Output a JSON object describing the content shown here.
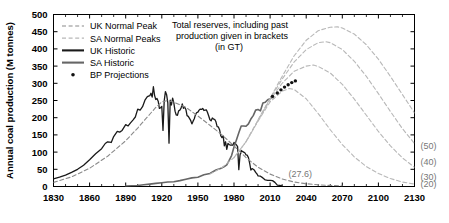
{
  "chart_data": {
    "type": "line",
    "title": "",
    "xlabel": "",
    "ylabel": "Annual coal production (M tonnes)",
    "xlim": [
      1830,
      2130
    ],
    "ylim": [
      0,
      500
    ],
    "xticks": [
      1830,
      1860,
      1890,
      1920,
      1950,
      1980,
      2010,
      2040,
      2070,
      2100,
      2130
    ],
    "yticks": [
      0,
      50,
      100,
      150,
      200,
      250,
      300,
      350,
      400,
      450,
      500
    ],
    "xtick_step": 30,
    "ytick_step": 50,
    "grid": false,
    "legend_position": "top-left",
    "annotation": {
      "line1": "Total reserves, including past",
      "line2": "production given in brackets",
      "line3": "(in GT)"
    },
    "inline_labels": [
      {
        "text": "(27.6)",
        "x": 2035,
        "y": 28
      }
    ],
    "right_axis_labels": [
      {
        "text": "(50)",
        "y": 118
      },
      {
        "text": "(40)",
        "y": 72
      },
      {
        "text": "(30)",
        "y": 30
      },
      {
        "text": "(20)",
        "y": 7
      }
    ],
    "legend": [
      {
        "label": "UK Normal Peak",
        "style": "dashed",
        "color": "#8a8a8a"
      },
      {
        "label": "SA Normal Peaks",
        "style": "dashed",
        "color": "#b8b8b8"
      },
      {
        "label": "UK Historic",
        "style": "solid",
        "color": "#1a1a1a"
      },
      {
        "label": "SA Historic",
        "style": "solid",
        "color": "#666666"
      },
      {
        "label": "BP Projections",
        "style": "dots",
        "color": "#111111"
      }
    ],
    "series": [
      {
        "name": "UK Historic",
        "style": "solid",
        "color": "#1a1a1a",
        "width": 1.3,
        "points": [
          [
            1830,
            22
          ],
          [
            1835,
            27
          ],
          [
            1840,
            33
          ],
          [
            1845,
            41
          ],
          [
            1850,
            50
          ],
          [
            1855,
            62
          ],
          [
            1860,
            78
          ],
          [
            1865,
            95
          ],
          [
            1870,
            110
          ],
          [
            1873,
            125
          ],
          [
            1875,
            130
          ],
          [
            1878,
            128
          ],
          [
            1880,
            145
          ],
          [
            1883,
            160
          ],
          [
            1885,
            158
          ],
          [
            1887,
            163
          ],
          [
            1890,
            180
          ],
          [
            1892,
            176
          ],
          [
            1894,
            185
          ],
          [
            1896,
            193
          ],
          [
            1898,
            202
          ],
          [
            1900,
            225
          ],
          [
            1902,
            222
          ],
          [
            1904,
            232
          ],
          [
            1906,
            251
          ],
          [
            1908,
            261
          ],
          [
            1910,
            264
          ],
          [
            1911,
            271
          ],
          [
            1912,
            260
          ],
          [
            1913,
            290
          ],
          [
            1914,
            265
          ],
          [
            1915,
            253
          ],
          [
            1916,
            256
          ],
          [
            1917,
            248
          ],
          [
            1918,
            227
          ],
          [
            1919,
            229
          ],
          [
            1920,
            233
          ],
          [
            1921,
            163
          ],
          [
            1922,
            249
          ],
          [
            1923,
            276
          ],
          [
            1924,
            267
          ],
          [
            1925,
            243
          ],
          [
            1926,
            126
          ],
          [
            1927,
            251
          ],
          [
            1928,
            237
          ],
          [
            1929,
            257
          ],
          [
            1930,
            243
          ],
          [
            1931,
            219
          ],
          [
            1932,
            208
          ],
          [
            1933,
            207
          ],
          [
            1934,
            220
          ],
          [
            1935,
            222
          ],
          [
            1936,
            228
          ],
          [
            1937,
            240
          ],
          [
            1938,
            227
          ],
          [
            1939,
            231
          ],
          [
            1940,
            224
          ],
          [
            1941,
            206
          ],
          [
            1942,
            204
          ],
          [
            1943,
            198
          ],
          [
            1944,
            192
          ],
          [
            1945,
            182
          ],
          [
            1946,
            190
          ],
          [
            1947,
            197
          ],
          [
            1948,
            209
          ],
          [
            1949,
            215
          ],
          [
            1950,
            216
          ],
          [
            1951,
            222
          ],
          [
            1952,
            225
          ],
          [
            1953,
            224
          ],
          [
            1954,
            227
          ],
          [
            1955,
            221
          ],
          [
            1956,
            222
          ],
          [
            1957,
            223
          ],
          [
            1958,
            215
          ],
          [
            1959,
            205
          ],
          [
            1960,
            194
          ],
          [
            1961,
            191
          ],
          [
            1962,
            199
          ],
          [
            1963,
            196
          ],
          [
            1964,
            195
          ],
          [
            1965,
            188
          ],
          [
            1966,
            174
          ],
          [
            1967,
            173
          ],
          [
            1968,
            165
          ],
          [
            1969,
            148
          ],
          [
            1970,
            142
          ],
          [
            1971,
            147
          ],
          [
            1972,
            118
          ],
          [
            1973,
            130
          ],
          [
            1974,
            108
          ],
          [
            1975,
            125
          ],
          [
            1976,
            122
          ],
          [
            1977,
            120
          ],
          [
            1978,
            121
          ],
          [
            1979,
            120
          ],
          [
            1980,
            128
          ],
          [
            1981,
            125
          ],
          [
            1982,
            121
          ],
          [
            1983,
            116
          ],
          [
            1984,
            49
          ],
          [
            1985,
            91
          ],
          [
            1986,
            105
          ],
          [
            1987,
            102
          ],
          [
            1988,
            100
          ],
          [
            1989,
            98
          ],
          [
            1990,
            92
          ],
          [
            1991,
            91
          ],
          [
            1992,
            84
          ],
          [
            1993,
            68
          ],
          [
            1994,
            48
          ],
          [
            1995,
            52
          ],
          [
            1996,
            50
          ],
          [
            1997,
            47
          ],
          [
            1998,
            41
          ],
          [
            1999,
            37
          ],
          [
            2000,
            31
          ],
          [
            2002,
            30
          ],
          [
            2004,
            25
          ],
          [
            2006,
            19
          ],
          [
            2008,
            18
          ],
          [
            2010,
            18
          ],
          [
            2012,
            17
          ],
          [
            2014,
            12
          ],
          [
            2016,
            4
          ],
          [
            2018,
            3
          ],
          [
            2020,
            2
          ]
        ]
      },
      {
        "name": "SA Historic",
        "style": "solid",
        "color": "#666666",
        "width": 1.6,
        "points": [
          [
            1890,
            1
          ],
          [
            1895,
            2
          ],
          [
            1900,
            3
          ],
          [
            1905,
            5
          ],
          [
            1910,
            7
          ],
          [
            1915,
            9
          ],
          [
            1920,
            11
          ],
          [
            1925,
            13
          ],
          [
            1930,
            14
          ],
          [
            1935,
            17
          ],
          [
            1940,
            21
          ],
          [
            1945,
            25
          ],
          [
            1950,
            27
          ],
          [
            1955,
            34
          ],
          [
            1960,
            38
          ],
          [
            1965,
            48
          ],
          [
            1970,
            54
          ],
          [
            1972,
            58
          ],
          [
            1974,
            63
          ],
          [
            1976,
            76
          ],
          [
            1978,
            90
          ],
          [
            1980,
            115
          ],
          [
            1982,
            135
          ],
          [
            1984,
            156
          ],
          [
            1986,
            176
          ],
          [
            1988,
            176
          ],
          [
            1990,
            175
          ],
          [
            1992,
            182
          ],
          [
            1994,
            196
          ],
          [
            1996,
            206
          ],
          [
            1998,
            222
          ],
          [
            2000,
            224
          ],
          [
            2002,
            220
          ],
          [
            2004,
            243
          ],
          [
            2006,
            245
          ],
          [
            2008,
            252
          ],
          [
            2010,
            255
          ],
          [
            2012,
            259
          ],
          [
            2013,
            257
          ]
        ]
      },
      {
        "name": "UK Normal Peak",
        "style": "dashed",
        "color": "#8a8a8a",
        "width": 1.1,
        "points": [
          [
            1830,
            12
          ],
          [
            1845,
            28
          ],
          [
            1860,
            53
          ],
          [
            1875,
            88
          ],
          [
            1890,
            133
          ],
          [
            1900,
            170
          ],
          [
            1910,
            210
          ],
          [
            1915,
            230
          ],
          [
            1920,
            246
          ],
          [
            1925,
            250
          ],
          [
            1930,
            245
          ],
          [
            1940,
            230
          ],
          [
            1950,
            205
          ],
          [
            1960,
            178
          ],
          [
            1970,
            150
          ],
          [
            1980,
            118
          ],
          [
            1990,
            84
          ],
          [
            2000,
            56
          ],
          [
            2010,
            36
          ],
          [
            2020,
            22
          ],
          [
            2030,
            13
          ],
          [
            2040,
            8
          ],
          [
            2050,
            5
          ],
          [
            2060,
            3
          ],
          [
            2070,
            2
          ]
        ]
      },
      {
        "name": "SA Normal Peak A (20)",
        "style": "dashed",
        "color": "#b8b8b8",
        "width": 1.1,
        "reserve_gt": 20,
        "points": [
          [
            1960,
            36
          ],
          [
            1970,
            55
          ],
          [
            1980,
            84
          ],
          [
            1990,
            130
          ],
          [
            2000,
            190
          ],
          [
            2010,
            246
          ],
          [
            2020,
            277
          ],
          [
            2026,
            285
          ],
          [
            2030,
            282
          ],
          [
            2040,
            255
          ],
          [
            2050,
            212
          ],
          [
            2060,
            165
          ],
          [
            2070,
            122
          ],
          [
            2080,
            86
          ],
          [
            2090,
            58
          ],
          [
            2100,
            38
          ],
          [
            2110,
            23
          ],
          [
            2120,
            13
          ],
          [
            2130,
            7
          ]
        ]
      },
      {
        "name": "SA Normal Peak B (30)",
        "style": "dashed",
        "color": "#b8b8b8",
        "width": 1.1,
        "reserve_gt": 30,
        "points": [
          [
            1980,
            84
          ],
          [
            1990,
            130
          ],
          [
            2000,
            192
          ],
          [
            2010,
            252
          ],
          [
            2020,
            300
          ],
          [
            2030,
            335
          ],
          [
            2040,
            350
          ],
          [
            2046,
            353
          ],
          [
            2050,
            349
          ],
          [
            2060,
            330
          ],
          [
            2070,
            297
          ],
          [
            2080,
            254
          ],
          [
            2090,
            207
          ],
          [
            2100,
            160
          ],
          [
            2110,
            118
          ],
          [
            2120,
            83
          ],
          [
            2130,
            56
          ]
        ]
      },
      {
        "name": "SA Normal Peak C (40)",
        "style": "dashed",
        "color": "#b8b8b8",
        "width": 1.1,
        "reserve_gt": 40,
        "points": [
          [
            1990,
            131
          ],
          [
            2000,
            193
          ],
          [
            2010,
            255
          ],
          [
            2020,
            312
          ],
          [
            2030,
            362
          ],
          [
            2040,
            398
          ],
          [
            2050,
            418
          ],
          [
            2056,
            421
          ],
          [
            2060,
            418
          ],
          [
            2070,
            398
          ],
          [
            2080,
            364
          ],
          [
            2090,
            320
          ],
          [
            2100,
            270
          ],
          [
            2110,
            218
          ],
          [
            2120,
            168
          ],
          [
            2130,
            125
          ]
        ]
      },
      {
        "name": "SA Normal Peak D (50)",
        "style": "dashed",
        "color": "#b8b8b8",
        "width": 1.1,
        "reserve_gt": 50,
        "points": [
          [
            2000,
            194
          ],
          [
            2010,
            257
          ],
          [
            2020,
            320
          ],
          [
            2030,
            380
          ],
          [
            2040,
            425
          ],
          [
            2050,
            453
          ],
          [
            2060,
            463
          ],
          [
            2066,
            464
          ],
          [
            2070,
            461
          ],
          [
            2080,
            443
          ],
          [
            2090,
            412
          ],
          [
            2100,
            370
          ],
          [
            2110,
            320
          ],
          [
            2120,
            267
          ],
          [
            2130,
            214
          ]
        ]
      },
      {
        "name": "BP Projections",
        "style": "dots",
        "color": "#111111",
        "points": [
          [
            2012,
            262
          ],
          [
            2016,
            272
          ],
          [
            2019,
            281
          ],
          [
            2022,
            289
          ],
          [
            2025,
            296
          ],
          [
            2028,
            302
          ],
          [
            2031,
            307
          ]
        ]
      }
    ]
  }
}
